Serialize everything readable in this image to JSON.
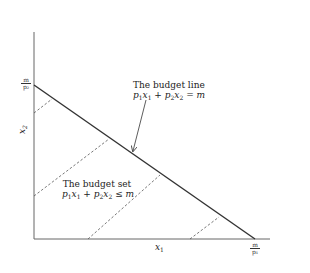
{
  "diagram": {
    "type": "budget-constraint",
    "axes": {
      "x_label": "x",
      "x_label_sub": "1",
      "y_label": "x",
      "y_label_sub": "2"
    },
    "intercepts": {
      "y_intercept": {
        "numerator": "m",
        "denominator": "p₂"
      },
      "x_intercept": {
        "numerator": "m",
        "denominator": "p₁"
      }
    },
    "budget_line": {
      "title": "The budget line",
      "equation_parts": [
        "p",
        "1",
        "x",
        "1",
        " + ",
        "p",
        "2",
        "x",
        "2",
        " = ",
        "m"
      ]
    },
    "budget_set": {
      "title": "The budget set",
      "equation_parts": [
        "p",
        "1",
        "x",
        "1",
        " + ",
        "p",
        "2",
        "x",
        "2",
        " ≤ ",
        "m"
      ]
    },
    "colors": {
      "axis": "#555555",
      "budget_line": "#333333",
      "dashed": "#555555",
      "text": "#222222"
    },
    "geometry": {
      "origin": [
        34,
        239
      ],
      "y_axis_top": [
        34,
        32
      ],
      "x_axis_right": [
        270,
        239
      ],
      "budget_line_start": [
        34,
        85
      ],
      "budget_line_end": [
        255,
        239
      ],
      "dashed_segments": [
        [
          [
            34,
            113
          ],
          [
            52,
            99
          ]
        ],
        [
          [
            34,
            196
          ],
          [
            109,
            139
          ]
        ],
        [
          [
            88,
            239
          ],
          [
            160,
            175
          ]
        ],
        [
          [
            190,
            239
          ],
          [
            219,
            217
          ]
        ]
      ],
      "arrow_from": [
        146,
        100
      ],
      "arrow_to": [
        133,
        152
      ]
    }
  }
}
